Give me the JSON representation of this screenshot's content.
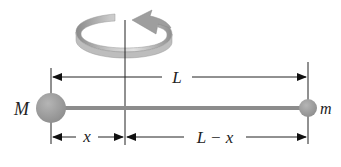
{
  "figure": {
    "labels": {
      "total_length": "L",
      "left_mass": "M",
      "right_mass": "m",
      "left_distance": "x",
      "right_distance": "L − x"
    },
    "colors": {
      "ball": "#9a9a9a",
      "rod": "#8c8c8c",
      "lines": "#222222",
      "rotation_arrow": "#a8a8a8"
    }
  }
}
